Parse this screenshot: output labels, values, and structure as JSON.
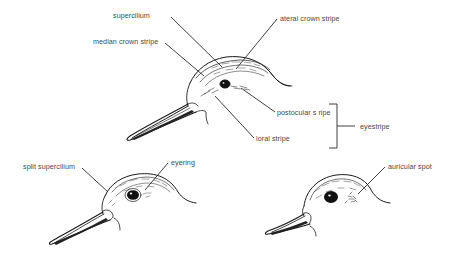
{
  "diagram": {
    "figures": [
      {
        "id": "top",
        "labels": [
          {
            "key": "supercilium",
            "text": "supercilium"
          },
          {
            "key": "lateral_crown_stripe",
            "text": "ateral crown stripe"
          },
          {
            "key": "median_crown_stripe",
            "text": "median crown stripe"
          },
          {
            "key": "postocular_stripe",
            "text": "postocular s ripe"
          },
          {
            "key": "loral_stripe",
            "text": "loral stripe"
          },
          {
            "key": "eyestripe",
            "text": "eyestripe"
          }
        ],
        "bracket_groups": [
          {
            "label": "eyestripe",
            "members": [
              "postocular s ripe",
              "loral stripe"
            ]
          }
        ]
      },
      {
        "id": "bottom-left",
        "labels": [
          {
            "key": "split_supercilium",
            "text": "split supercilium"
          },
          {
            "key": "eyering",
            "text": "eyering"
          }
        ]
      },
      {
        "id": "bottom-right",
        "labels": [
          {
            "key": "auricular_spot",
            "text": "auricular spot"
          }
        ]
      }
    ]
  },
  "labels": {
    "supercilium": "supercilium",
    "lateral_crown_stripe": "ateral crown stripe",
    "median_crown_stripe": "median crown stripe",
    "postocular_stripe": "postocular s ripe",
    "loral_stripe": "loral stripe",
    "eyestripe": "eyestripe",
    "split_supercilium": "split supercilium",
    "eyering": "eyering",
    "auricular_spot": "auricular spot"
  },
  "colors": {
    "ink": "#1a1a1a",
    "label_text": "#4a4a4a",
    "background": "#ffffff"
  }
}
